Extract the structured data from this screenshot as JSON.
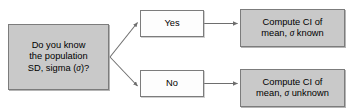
{
  "diagram": {
    "background_color": "#ffffff",
    "node_fill_gray": "#c9c9c9",
    "node_fill_white": "#fdfdfd",
    "node_border_color": "#7c7c7c",
    "edge_color": "#6e6e6e",
    "nodes": {
      "question": {
        "id": "question",
        "label": "Do you know\nthe population\nSD, sigma (σ)?",
        "shape": "rectangle",
        "fill": "gray"
      },
      "yes": {
        "id": "yes",
        "label": "Yes",
        "shape": "rectangle",
        "fill": "white"
      },
      "no": {
        "id": "no",
        "label": "No",
        "shape": "rectangle",
        "fill": "white"
      },
      "ci_known": {
        "id": "ci_known",
        "label": "Compute CI of\nmean, σ known",
        "shape": "rectangle",
        "fill": "gray"
      },
      "ci_unknown": {
        "id": "ci_unknown",
        "label": "Compute CI of\nmean, σ unknown",
        "shape": "rectangle",
        "fill": "gray"
      }
    },
    "edges": [
      {
        "id": "question-to-yes",
        "from": "question",
        "to": "yes",
        "label": "",
        "style": "diagonal-arrow"
      },
      {
        "id": "question-to-no",
        "from": "question",
        "to": "no",
        "label": "",
        "style": "diagonal-arrow"
      },
      {
        "id": "yes-to-ci-known",
        "from": "yes",
        "to": "ci_known",
        "label": "",
        "style": "horizontal-arrow"
      },
      {
        "id": "no-to-ci-unknown",
        "from": "no",
        "to": "ci_unknown",
        "label": "",
        "style": "horizontal-arrow"
      }
    ]
  }
}
